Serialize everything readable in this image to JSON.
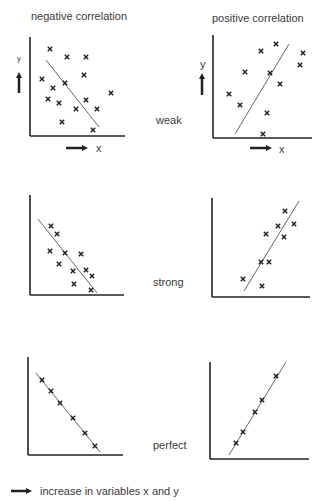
{
  "headers": {
    "left": "negative correlation",
    "right": "positive correlation"
  },
  "rows": {
    "weak": "weak",
    "strong": "strong",
    "perfect": "perfect"
  },
  "axis_labels": {
    "x": "x",
    "y": "y"
  },
  "legend": {
    "text": "increase in variables x and y",
    "icon": "arrow-right-icon"
  },
  "colors": {
    "ink": "#222222",
    "text": "#3a3a3a",
    "background": "#ffffff"
  },
  "chart_data": [
    {
      "type": "scatter",
      "title": "negative correlation - weak",
      "trend": "negative",
      "strength": "weak",
      "axes": {
        "origin": [
          30,
          136
        ],
        "x_end": 125,
        "y_top": 37
      },
      "points": [
        [
          50,
          49
        ],
        [
          67,
          57
        ],
        [
          86,
          57
        ],
        [
          42,
          79
        ],
        [
          65,
          83
        ],
        [
          84,
          75
        ],
        [
          53,
          88
        ],
        [
          48,
          99
        ],
        [
          59,
          103
        ],
        [
          76,
          109
        ],
        [
          86,
          100
        ],
        [
          97,
          109
        ],
        [
          111,
          93
        ],
        [
          62,
          122
        ],
        [
          93,
          130
        ]
      ],
      "line": [
        [
          46,
          60
        ],
        [
          99,
          127
        ]
      ]
    },
    {
      "type": "scatter",
      "title": "positive correlation - weak",
      "trend": "positive",
      "strength": "weak",
      "axes": {
        "origin": [
          213,
          138
        ],
        "x_end": 312,
        "y_top": 35
      },
      "points": [
        [
          229,
          94
        ],
        [
          240,
          105
        ],
        [
          245,
          72
        ],
        [
          261,
          51
        ],
        [
          276,
          44
        ],
        [
          270,
          73
        ],
        [
          280,
          84
        ],
        [
          267,
          113
        ],
        [
          263,
          134
        ],
        [
          300,
          65
        ],
        [
          303,
          53
        ]
      ],
      "line": [
        [
          235,
          134
        ],
        [
          289,
          44
        ]
      ]
    },
    {
      "type": "scatter",
      "title": "negative correlation - strong",
      "trend": "negative",
      "strength": "strong",
      "axes": {
        "origin": [
          30,
          295
        ],
        "x_end": 124,
        "y_top": 195
      },
      "points": [
        [
          51,
          226
        ],
        [
          57,
          234
        ],
        [
          50,
          251
        ],
        [
          65,
          253
        ],
        [
          81,
          254
        ],
        [
          59,
          264
        ],
        [
          73,
          271
        ],
        [
          86,
          270
        ],
        [
          92,
          276
        ],
        [
          74,
          284
        ],
        [
          91,
          290
        ]
      ],
      "line": [
        [
          38,
          219
        ],
        [
          97,
          293
        ]
      ]
    },
    {
      "type": "scatter",
      "title": "positive correlation - strong",
      "trend": "positive",
      "strength": "strong",
      "axes": {
        "origin": [
          212,
          297
        ],
        "x_end": 310,
        "y_top": 198
      },
      "points": [
        [
          285,
          211
        ],
        [
          278,
          226
        ],
        [
          294,
          224
        ],
        [
          266,
          234
        ],
        [
          284,
          237
        ],
        [
          261,
          262
        ],
        [
          269,
          262
        ],
        [
          243,
          279
        ],
        [
          262,
          286
        ]
      ],
      "line": [
        [
          244,
          291
        ],
        [
          299,
          201
        ]
      ]
    },
    {
      "type": "scatter",
      "title": "negative correlation - perfect",
      "trend": "negative",
      "strength": "perfect",
      "axes": {
        "origin": [
          28,
          455
        ],
        "x_end": 123,
        "y_top": 357
      },
      "points": [
        [
          42,
          380
        ],
        [
          51,
          391
        ],
        [
          60,
          403
        ],
        [
          73,
          418
        ],
        [
          85,
          433
        ],
        [
          95,
          446
        ]
      ],
      "line": [
        [
          36,
          373
        ],
        [
          100,
          452
        ]
      ]
    },
    {
      "type": "scatter",
      "title": "positive correlation - perfect",
      "trend": "positive",
      "strength": "perfect",
      "axes": {
        "origin": [
          210,
          459
        ],
        "x_end": 309,
        "y_top": 362
      },
      "points": [
        [
          276,
          376
        ],
        [
          262,
          400
        ],
        [
          255,
          412
        ],
        [
          243,
          432
        ],
        [
          236,
          443
        ]
      ],
      "line": [
        [
          229,
          455
        ],
        [
          286,
          362
        ]
      ]
    }
  ]
}
